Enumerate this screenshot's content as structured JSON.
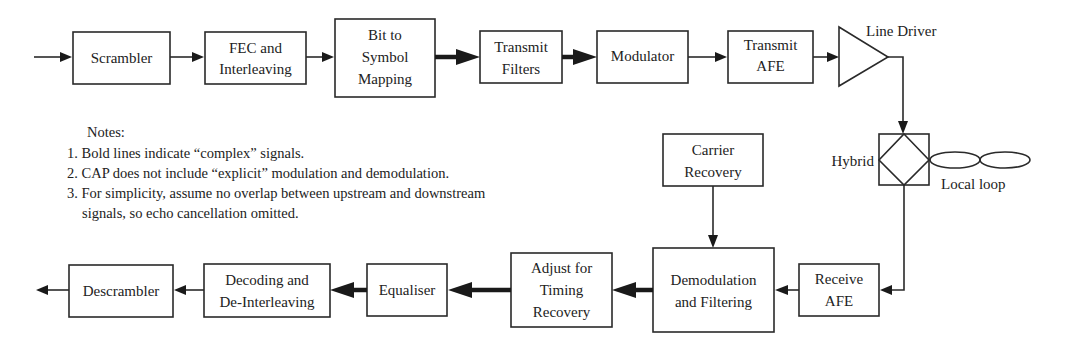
{
  "diagram": {
    "transmit_chain": [
      {
        "id": "scrambler",
        "lines": [
          "Scrambler"
        ]
      },
      {
        "id": "fec",
        "lines": [
          "FEC and",
          "Interleaving"
        ]
      },
      {
        "id": "bit-to-symbol",
        "lines": [
          "Bit to",
          "Symbol",
          "Mapping"
        ]
      },
      {
        "id": "transmit-filters",
        "lines": [
          "Transmit",
          "Filters"
        ]
      },
      {
        "id": "modulator",
        "lines": [
          "Modulator"
        ]
      },
      {
        "id": "transmit-afe",
        "lines": [
          "Transmit",
          "AFE"
        ]
      }
    ],
    "line_driver": {
      "label": "Line Driver"
    },
    "hybrid": {
      "label": "Hybrid"
    },
    "local_loop": {
      "label": "Local loop"
    },
    "carrier_recovery": {
      "lines": [
        "Carrier",
        "Recovery"
      ]
    },
    "receive_chain": [
      {
        "id": "receive-afe",
        "lines": [
          "Receive",
          "AFE"
        ]
      },
      {
        "id": "demodulation",
        "lines": [
          "Demodulation",
          "and Filtering"
        ]
      },
      {
        "id": "adjust-timing",
        "lines": [
          "Adjust for",
          "Timing",
          "Recovery"
        ]
      },
      {
        "id": "equaliser",
        "lines": [
          "Equaliser"
        ]
      },
      {
        "id": "decoding",
        "lines": [
          "Decoding and",
          "De-Interleaving"
        ]
      },
      {
        "id": "descrambler",
        "lines": [
          "Descrambler"
        ]
      }
    ],
    "notes": {
      "title": "Notes:",
      "items": [
        "1. Bold lines indicate “complex” signals.",
        "2. CAP does not include “explicit” modulation and demodulation.",
        "3. For simplicity, assume no overlap between upstream and downstream",
        "signals, so echo cancellation omitted."
      ]
    }
  }
}
